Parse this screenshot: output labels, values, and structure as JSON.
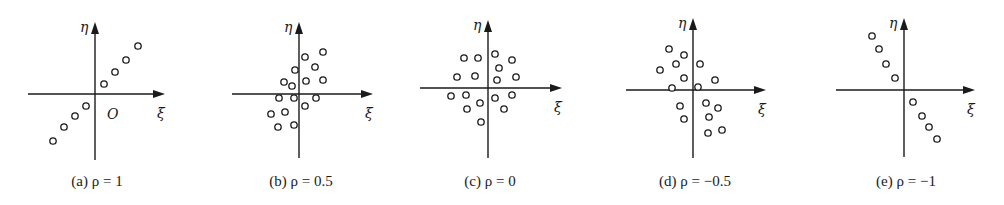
{
  "figure": {
    "x_axis_label": "ξ",
    "y_axis_label": "η",
    "origin_label": "O"
  },
  "chart_data": [
    {
      "type": "scatter",
      "title": "(a) ρ = 1",
      "xlabel": "ξ",
      "ylabel": "η",
      "grid": false,
      "points": [
        [
          -4,
          -4
        ],
        [
          -3,
          -3
        ],
        [
          -2,
          -2
        ],
        [
          -1,
          -1
        ],
        [
          1,
          1
        ],
        [
          2,
          2
        ],
        [
          3,
          3
        ],
        [
          4,
          4
        ]
      ]
    },
    {
      "type": "scatter",
      "title": "(b) ρ = 0.5",
      "xlabel": "ξ",
      "ylabel": "η",
      "grid": false,
      "points": [
        [
          2.2,
          4.0
        ],
        [
          0.5,
          3.5
        ],
        [
          1.5,
          2.5
        ],
        [
          -0.4,
          2.2
        ],
        [
          0.6,
          1.2
        ],
        [
          2.2,
          1.3
        ],
        [
          -1.4,
          1.1
        ],
        [
          -0.7,
          0.7
        ],
        [
          -1.9,
          -0.4
        ],
        [
          -0.5,
          -0.4
        ],
        [
          1.6,
          -0.4
        ],
        [
          0.6,
          -1.1
        ],
        [
          -2.6,
          -1.8
        ],
        [
          -1.3,
          -1.7
        ],
        [
          -2.0,
          -3.1
        ],
        [
          -0.5,
          -2.9
        ]
      ]
    },
    {
      "type": "scatter",
      "title": "(c) ρ = 0",
      "xlabel": "ξ",
      "ylabel": "η",
      "grid": false,
      "points": [
        [
          -2.3,
          2.9
        ],
        [
          -1.0,
          2.9
        ],
        [
          0.7,
          3.3
        ],
        [
          2.3,
          2.7
        ],
        [
          1.1,
          1.9
        ],
        [
          -3.0,
          1.0
        ],
        [
          -1.2,
          1.1
        ],
        [
          2.7,
          1.0
        ],
        [
          0.8,
          0.7
        ],
        [
          -3.6,
          -0.8
        ],
        [
          -2.1,
          -0.7
        ],
        [
          0.7,
          -1.0
        ],
        [
          2.3,
          -0.7
        ],
        [
          -2.0,
          -2.0
        ],
        [
          -0.8,
          -1.4
        ],
        [
          1.5,
          -2.0
        ],
        [
          -0.7,
          -3.3
        ]
      ]
    },
    {
      "type": "scatter",
      "title": "(d) ρ = −0.5",
      "xlabel": "ξ",
      "ylabel": "η",
      "grid": false,
      "points": [
        [
          -2.3,
          3.9
        ],
        [
          -0.9,
          3.4
        ],
        [
          -1.6,
          2.5
        ],
        [
          0.7,
          2.5
        ],
        [
          -3.1,
          1.9
        ],
        [
          -0.9,
          1.1
        ],
        [
          2.1,
          0.9
        ],
        [
          -2.0,
          0.2
        ],
        [
          0.5,
          0.3
        ],
        [
          -1.2,
          -1.5
        ],
        [
          1.2,
          -1.2
        ],
        [
          2.4,
          -1.7
        ],
        [
          -0.9,
          -2.8
        ],
        [
          1.5,
          -2.6
        ],
        [
          2.8,
          -3.8
        ],
        [
          1.4,
          -4.1
        ]
      ]
    },
    {
      "type": "scatter",
      "title": "(e) ρ = −1",
      "xlabel": "ξ",
      "ylabel": "η",
      "grid": false,
      "points": [
        [
          -4,
          4
        ],
        [
          -3,
          3
        ],
        [
          -2,
          2
        ],
        [
          -1,
          1
        ],
        [
          1,
          -1
        ],
        [
          2,
          -2
        ],
        [
          3,
          -3
        ],
        [
          4,
          -4
        ]
      ]
    }
  ],
  "panels": [
    {
      "caption": "(a) ρ = 1",
      "ox": 95,
      "oy": 94,
      "ytop": 22,
      "ybot": 160,
      "xl": 28,
      "xr": 165,
      "show_origin": true,
      "px": [
        [
          138,
          46
        ],
        [
          126,
          60
        ],
        [
          115,
          72
        ],
        [
          104,
          84
        ],
        [
          86,
          106
        ],
        [
          75,
          116
        ],
        [
          64,
          127
        ],
        [
          53,
          141
        ]
      ]
    },
    {
      "caption": "(b) ρ = 0.5",
      "ox": 299,
      "oy": 94,
      "ytop": 22,
      "ybot": 158,
      "xl": 232,
      "xr": 373,
      "show_origin": false,
      "px": [
        [
          323,
          52
        ],
        [
          305,
          57
        ],
        [
          315,
          67
        ],
        [
          295,
          70
        ],
        [
          306,
          81
        ],
        [
          323,
          80
        ],
        [
          284,
          82
        ],
        [
          292,
          86
        ],
        [
          279,
          98
        ],
        [
          294,
          98
        ],
        [
          316,
          98
        ],
        [
          305,
          106
        ],
        [
          271,
          114
        ],
        [
          285,
          112
        ],
        [
          278,
          127
        ],
        [
          294,
          125
        ]
      ]
    },
    {
      "caption": "(c) ρ = 0",
      "ox": 488,
      "oy": 88,
      "ytop": 20,
      "ybot": 158,
      "xl": 420,
      "xr": 562,
      "show_origin": false,
      "px": [
        [
          464,
          58
        ],
        [
          478,
          58
        ],
        [
          495,
          54
        ],
        [
          512,
          60
        ],
        [
          499,
          68
        ],
        [
          457,
          77
        ],
        [
          475,
          76
        ],
        [
          516,
          77
        ],
        [
          497,
          80
        ],
        [
          451,
          96
        ],
        [
          466,
          95
        ],
        [
          495,
          98
        ],
        [
          512,
          95
        ],
        [
          467,
          109
        ],
        [
          480,
          103
        ],
        [
          504,
          109
        ],
        [
          481,
          122
        ]
      ]
    },
    {
      "caption": "(d) ρ = −0.5",
      "ox": 693,
      "oy": 90,
      "ytop": 18,
      "ybot": 158,
      "xl": 626,
      "xr": 766,
      "show_origin": false,
      "px": [
        [
          669,
          49
        ],
        [
          684,
          55
        ],
        [
          676,
          64
        ],
        [
          700,
          64
        ],
        [
          660,
          70
        ],
        [
          684,
          78
        ],
        [
          715,
          80
        ],
        [
          672,
          88
        ],
        [
          698,
          87
        ],
        [
          680,
          106
        ],
        [
          706,
          103
        ],
        [
          718,
          108
        ],
        [
          684,
          119
        ],
        [
          709,
          117
        ],
        [
          722,
          130
        ],
        [
          708,
          133
        ]
      ]
    },
    {
      "caption": "(e) ρ = −1",
      "ox": 904,
      "oy": 90,
      "ytop": 18,
      "ybot": 157,
      "xl": 836,
      "xr": 975,
      "show_origin": false,
      "px": [
        [
          872,
          36
        ],
        [
          879,
          49
        ],
        [
          886,
          64
        ],
        [
          895,
          78
        ],
        [
          913,
          102
        ],
        [
          922,
          116
        ],
        [
          929,
          127
        ],
        [
          937,
          139
        ]
      ]
    }
  ]
}
